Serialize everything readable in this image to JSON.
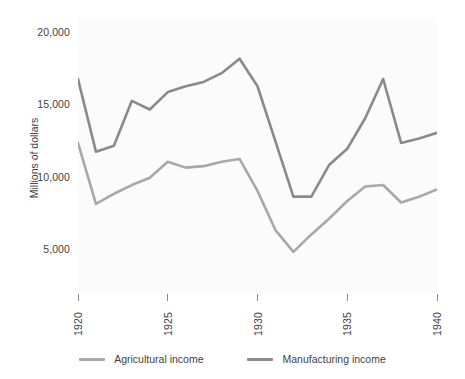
{
  "chart_data": {
    "type": "line",
    "title": "",
    "xlabel": "",
    "ylabel": "Millions of dollars",
    "x": [
      1920,
      1921,
      1922,
      1923,
      1924,
      1925,
      1926,
      1927,
      1928,
      1929,
      1930,
      1931,
      1932,
      1933,
      1934,
      1935,
      1936,
      1937,
      1938,
      1939,
      1940
    ],
    "xlim": [
      1920,
      1940
    ],
    "ylim": [
      2000,
      21000
    ],
    "xticks": [
      1920,
      1925,
      1930,
      1935,
      1940
    ],
    "xtick_labels": [
      "1920",
      "1925",
      "1930",
      "1935",
      "1940"
    ],
    "yticks": [
      5000,
      10000,
      15000,
      20000
    ],
    "ytick_labels": [
      "5,000",
      "10,000",
      "15,000",
      "20,000"
    ],
    "grid": false,
    "legend_position": "bottom",
    "series": [
      {
        "name": "Agricultural income",
        "color": "#a8a8a8",
        "values": [
          12400,
          8200,
          8900,
          9500,
          10000,
          11100,
          10700,
          10800,
          11100,
          11300,
          9100,
          6400,
          4900,
          6100,
          7200,
          8400,
          9400,
          9500,
          8300,
          8700,
          9200
        ]
      },
      {
        "name": "Manufacturing income",
        "color": "#8a8a8a",
        "values": [
          16800,
          11800,
          12200,
          15300,
          14700,
          15900,
          16300,
          16600,
          17200,
          18200,
          16300,
          12500,
          8700,
          8700,
          10900,
          12000,
          14100,
          16800,
          12400,
          12700,
          13100
        ]
      }
    ]
  },
  "legend": {
    "items": [
      {
        "label": "Agricultural income",
        "color": "#a8a8a8"
      },
      {
        "label": "Manufacturing income",
        "color": "#8a8a8a"
      }
    ]
  },
  "axes": {
    "y_title": "Millions of dollars"
  }
}
